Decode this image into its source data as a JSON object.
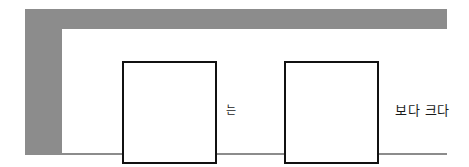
{
  "figure": {
    "type": "worksheet-comparison-template",
    "frame_color": "#8c8c8c",
    "panel_color": "#ffffff",
    "box_border_color": "#111111",
    "text_color": "#1a1a1a",
    "boxes": [
      {
        "label": "",
        "name": "left-answer-box"
      },
      {
        "label": "",
        "name": "right-answer-box"
      }
    ],
    "labels": {
      "particle": "는",
      "comparison": "보다 크다"
    }
  }
}
